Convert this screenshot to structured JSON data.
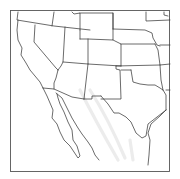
{
  "map": {
    "region": "Southwestern United States and Northern Mexico",
    "style": "outline map, black state borders on white",
    "colors": {
      "background": "#ffffff",
      "borders": "#3a3a3a",
      "frame": "#555555",
      "terrain_shading": "#ececec"
    },
    "frame": {
      "x": 10,
      "y": 10,
      "width": 160,
      "height": 162
    },
    "regions": [
      "California",
      "Nevada",
      "Oregon",
      "Idaho",
      "Utah",
      "Arizona",
      "Wyoming",
      "Colorado",
      "New Mexico",
      "Nebraska",
      "Kansas",
      "Oklahoma",
      "Texas",
      "South Dakota",
      "Iowa",
      "Missouri",
      "Arkansas",
      "Baja California",
      "Sonora",
      "Chihuahua",
      "Coahuila"
    ]
  }
}
